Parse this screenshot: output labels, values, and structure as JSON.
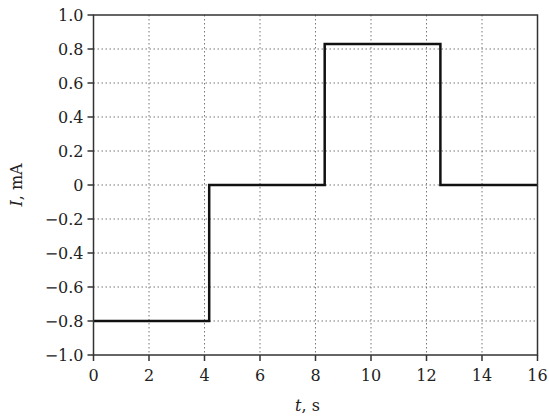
{
  "chart_data": {
    "type": "line",
    "style": "step",
    "title": "",
    "xlabel": "t, s",
    "xlabel_var": "t",
    "xlabel_unit": ", s",
    "ylabel": "I, mA",
    "ylabel_var": "I",
    "ylabel_unit": ", mA",
    "xlim": [
      0,
      16
    ],
    "ylim": [
      -1.0,
      1.0
    ],
    "xticks": [
      0,
      2,
      4,
      6,
      8,
      10,
      12,
      14,
      16
    ],
    "xtick_labels": [
      "0",
      "2",
      "4",
      "6",
      "8",
      "10",
      "12",
      "14",
      "16"
    ],
    "yticks": [
      1.0,
      0.8,
      0.6,
      0.4,
      0.2,
      0,
      -0.2,
      -0.4,
      -0.6,
      -0.8,
      -1.0
    ],
    "ytick_labels": [
      "1.0",
      "0.8",
      "0.6",
      "0.4",
      "0.2",
      "0",
      "−0.2",
      "−0.4",
      "−0.6",
      "−0.8",
      "−1.0"
    ],
    "grid": true,
    "grid_style": "dotted",
    "legend": null,
    "series": [
      {
        "name": "I(t)",
        "color": "#111111",
        "x": [
          0,
          4.17,
          4.17,
          8.33,
          8.33,
          12.5,
          12.5,
          16
        ],
        "y": [
          -0.8,
          -0.8,
          0,
          0,
          0.83,
          0.83,
          0,
          0
        ]
      }
    ]
  }
}
